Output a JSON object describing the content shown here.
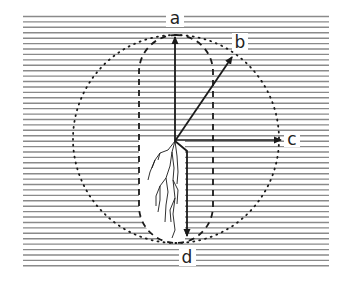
{
  "diagram": {
    "labels": {
      "a": "a",
      "b": "b",
      "c": "c",
      "d": "d"
    },
    "colors": {
      "lines": "#8a8a8a",
      "ink": "#1a1a1a",
      "background": "#ffffff"
    },
    "elements": [
      "horizontal-line-hatching-background",
      "dotted-circle",
      "dashed-capsule",
      "white-fracture-zone-with-branching-cracks",
      "vector-a-vertical-up",
      "vector-b-diagonal",
      "vector-c-horizontal-right",
      "vector-d-offset-down"
    ]
  }
}
